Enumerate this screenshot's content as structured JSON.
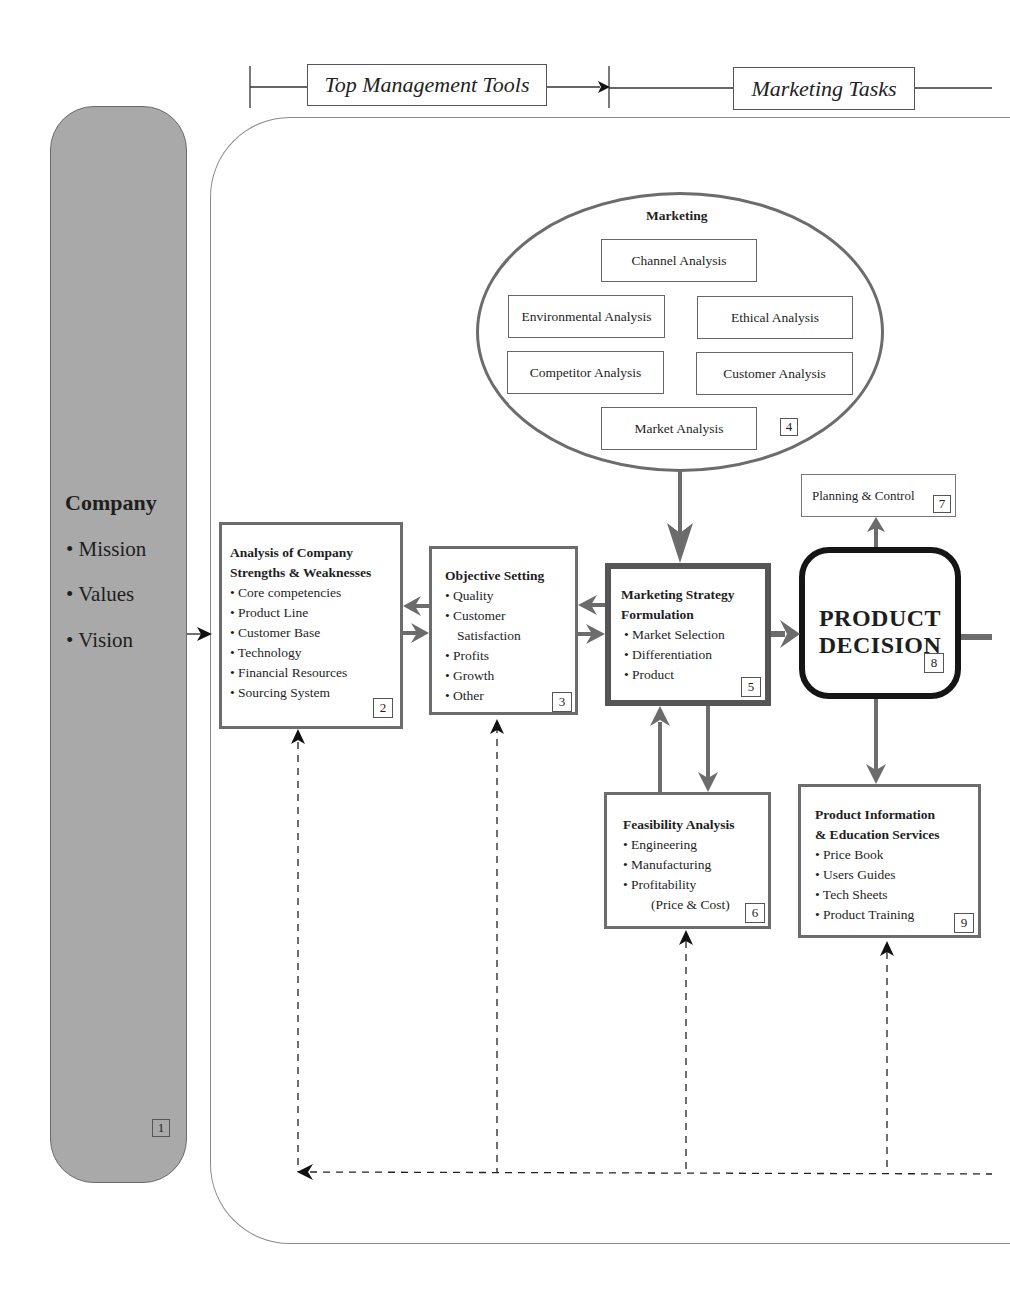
{
  "header": {
    "stage_1_label": "Top Management Tools",
    "stage_2_label": "Marketing Tasks"
  },
  "company": {
    "title": "Company",
    "items": [
      "• Mission",
      "• Values",
      "• Vision"
    ],
    "number": "1"
  },
  "analysis_box": {
    "title_line1": "Analysis of Company",
    "title_line2": "Strengths & Weaknesses",
    "items": [
      "• Core competencies",
      "• Product Line",
      "• Customer Base",
      "• Technology",
      "• Financial Resources",
      "• Sourcing System"
    ],
    "number": "2"
  },
  "objective_box": {
    "title": "Objective Setting",
    "items": [
      "• Quality",
      "• Customer",
      "Satisfaction",
      "• Profits",
      "• Growth",
      "• Other"
    ],
    "number": "3"
  },
  "marketing_ellipse": {
    "title": "Marketing",
    "boxes": [
      "Channel Analysis",
      "Environmental Analysis",
      "Ethical Analysis",
      "Competitor Analysis",
      "Customer Analysis",
      "Market Analysis"
    ],
    "number": "4"
  },
  "strategy_box": {
    "title_line1": "Marketing Strategy",
    "title_line2": "Formulation",
    "items": [
      "• Market Selection",
      "• Differentiation",
      "• Product"
    ],
    "number": "5"
  },
  "feasibility_box": {
    "title": "Feasibility Analysis",
    "items": [
      "• Engineering",
      "• Manufacturing",
      "• Profitability",
      "(Price & Cost)"
    ],
    "number": "6"
  },
  "planning_box": {
    "label": "Planning & Control",
    "number": "7"
  },
  "decision_box": {
    "line1": "PRODUCT",
    "line2": "DECISION",
    "number": "8"
  },
  "info_box": {
    "title_line1": "Product Information",
    "title_line2": "& Education Services",
    "items": [
      "• Price Book",
      "• Users Guides",
      "• Tech Sheets",
      "• Product Training"
    ],
    "number": "9"
  },
  "colors": {
    "arrow_gray": "#6c6c6c",
    "company_fill": "#a9a9a9",
    "decision_border": "#151515"
  }
}
